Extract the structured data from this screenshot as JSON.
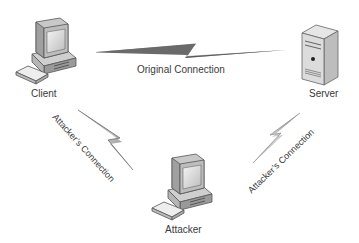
{
  "diagram": {
    "type": "man-in-the-middle network diagram",
    "nodes": [
      {
        "id": "client",
        "label": "Client",
        "icon": "desktop-computer-icon"
      },
      {
        "id": "server",
        "label": "Server",
        "icon": "server-tower-icon"
      },
      {
        "id": "attacker",
        "label": "Attacker",
        "icon": "desktop-computer-icon"
      }
    ],
    "edges": [
      {
        "from": "client",
        "to": "server",
        "label": "Original Connection",
        "style": "lightning-bolt"
      },
      {
        "from": "client",
        "to": "attacker",
        "label": "Attacker’s Connection",
        "style": "lightning-bolt"
      },
      {
        "from": "attacker",
        "to": "server",
        "label": "Attacker’s Connection",
        "style": "lightning-bolt"
      }
    ]
  },
  "colors": {
    "bolt_dark": "#555555",
    "bolt_light": "#bbbbbb",
    "device_body": "#d8d8d8",
    "device_outline": "#555555",
    "text": "#3a3a3a"
  }
}
